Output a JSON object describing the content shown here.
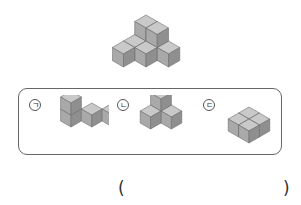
{
  "problem": {
    "main_figure": "stacked-cubes-figure",
    "choices": [
      {
        "label": "ㄱ",
        "figure": "L-shaped cube stack"
      },
      {
        "label": "ㄴ",
        "figure": "three-cube pyramid stack"
      },
      {
        "label": "ㄷ",
        "figure": "2x2 flat cube layer"
      }
    ],
    "answer_open": "(",
    "answer_close": ")",
    "answer_value": ""
  },
  "colors": {
    "cube_top": "#c9c9c9",
    "cube_left": "#a9a9a9",
    "cube_right": "#8f8f8f",
    "edge": "#6e6e6e",
    "border": "#666666"
  }
}
